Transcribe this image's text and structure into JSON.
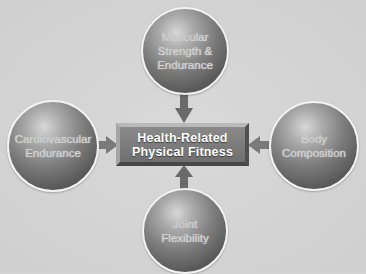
{
  "diagram": {
    "center": {
      "label": "Health-Related\nPhysical Fitness"
    },
    "components": [
      {
        "id": "top",
        "label": "Muscular\nStrength &\nEndurance"
      },
      {
        "id": "left",
        "label": "Cardiovascular\nEndurance"
      },
      {
        "id": "right",
        "label": "Body\nComposition"
      },
      {
        "id": "bottom",
        "label": "Joint\nFlexibility"
      }
    ],
    "arrows": [
      {
        "from": "top",
        "to": "center"
      },
      {
        "from": "left",
        "to": "center"
      },
      {
        "from": "right",
        "to": "center"
      },
      {
        "from": "bottom",
        "to": "center"
      }
    ],
    "colors": {
      "background": "#d3d3d3",
      "sphere": "#6e6e6e",
      "box": "#7a7a7a",
      "arrow": "#6a6a6a",
      "center_text": "#ffffff"
    }
  }
}
